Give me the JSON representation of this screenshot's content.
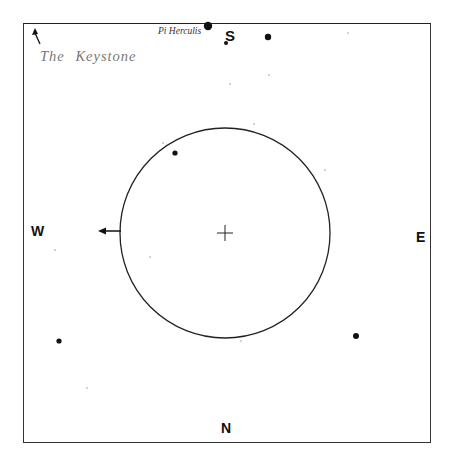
{
  "chart": {
    "title": "The Keystone",
    "star_label": "Pi Herculis",
    "directions": {
      "north": "N",
      "south": "S",
      "east": "E",
      "west": "W"
    },
    "frame": {
      "x": 23,
      "y": 23,
      "width": 408,
      "height": 420
    },
    "field_circle": {
      "cx": 225,
      "cy": 233,
      "r": 105
    },
    "center_mark": {
      "x": 225,
      "y": 233,
      "size": 8
    },
    "west_arrow": {
      "x1": 121,
      "y1": 231,
      "x2": 98,
      "y2": 231
    },
    "keystone_arrow": {
      "x1": 40,
      "y1": 44,
      "x2": 35,
      "y2": 28
    },
    "colors": {
      "ink": "#111111",
      "faint": "#999999",
      "title": "#777777"
    },
    "stars": [
      {
        "name": "Pi Herculis",
        "x": 208,
        "y": 26,
        "r": 4.2
      },
      {
        "x": 268,
        "y": 37,
        "r": 3.2
      },
      {
        "x": 226,
        "y": 43,
        "r": 2.0
      },
      {
        "x": 175,
        "y": 153,
        "r": 2.6
      },
      {
        "x": 356,
        "y": 336,
        "r": 3.0
      },
      {
        "x": 59,
        "y": 341,
        "r": 2.6
      }
    ],
    "faint_stars": [
      {
        "x": 348,
        "y": 33
      },
      {
        "x": 269,
        "y": 75
      },
      {
        "x": 230,
        "y": 84
      },
      {
        "x": 254,
        "y": 124
      },
      {
        "x": 163,
        "y": 143
      },
      {
        "x": 325,
        "y": 170
      },
      {
        "x": 150,
        "y": 257
      },
      {
        "x": 55,
        "y": 250
      },
      {
        "x": 241,
        "y": 341
      },
      {
        "x": 87,
        "y": 388
      }
    ]
  }
}
